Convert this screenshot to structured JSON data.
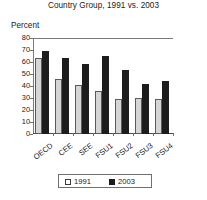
{
  "chart_data": {
    "type": "bar",
    "title": "Country Group, 1991 vs. 2003",
    "xlabel": "",
    "ylabel": "Percent",
    "ylim": [
      0,
      80
    ],
    "yticks": [
      0,
      10,
      20,
      30,
      40,
      50,
      60,
      70,
      80
    ],
    "ytick_labels": [
      "0",
      "10",
      "20",
      "30",
      "40",
      "50",
      "60",
      "70",
      "80"
    ],
    "grid": false,
    "legend_position": "bottom",
    "categories": [
      "OECD",
      "CEE",
      "SEE",
      "FSU1",
      "FSU2",
      "FSU3",
      "FSU4"
    ],
    "series": [
      {
        "name": "1991",
        "color": "#d6d6d6",
        "values": [
          63.5,
          45.5,
          41.0,
          36.0,
          29.5,
          30.0,
          29.0
        ]
      },
      {
        "name": "2003",
        "color": "#1c1c1c",
        "values": [
          69.0,
          63.0,
          58.0,
          65.0,
          53.0,
          42.0,
          44.0
        ]
      }
    ],
    "legend": [
      {
        "label": "1991",
        "swatch": "light-square-swatch"
      },
      {
        "label": "2003",
        "swatch": "dark-square-swatch"
      }
    ]
  }
}
